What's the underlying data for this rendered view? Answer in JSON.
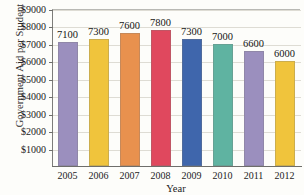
{
  "chart_data": {
    "type": "bar",
    "title": "",
    "xlabel": "Year",
    "ylabel": "Government Aid per Student",
    "categories": [
      "2005",
      "2006",
      "2007",
      "2008",
      "2009",
      "2010",
      "2011",
      "2012"
    ],
    "values": [
      7100,
      7300,
      7600,
      7800,
      7300,
      7000,
      6600,
      6000
    ],
    "value_labels": [
      "7100",
      "7300",
      "7600",
      "7800",
      "7300",
      "7000",
      "6600",
      "6000"
    ],
    "bar_colors": [
      "#9b8fbe",
      "#f0c43c",
      "#e8914e",
      "#e0485e",
      "#3f66ac",
      "#5fb3a1",
      "#9b8fbe",
      "#f0c43c"
    ],
    "ylim": [
      0,
      9000
    ],
    "ytick_values": [
      9000,
      8000,
      7000,
      6000,
      5000,
      4000,
      3000,
      2000,
      1000
    ],
    "ytick_labels": [
      "$9000",
      "$8000",
      "$7000",
      "$6000",
      "$5000",
      "$4000",
      "$3000",
      "$2000",
      "$1000"
    ],
    "grid": true,
    "legend": "none"
  },
  "axis": {
    "y_title": "Government Aid per Student",
    "x_title": "Year"
  },
  "title_fragment": ""
}
